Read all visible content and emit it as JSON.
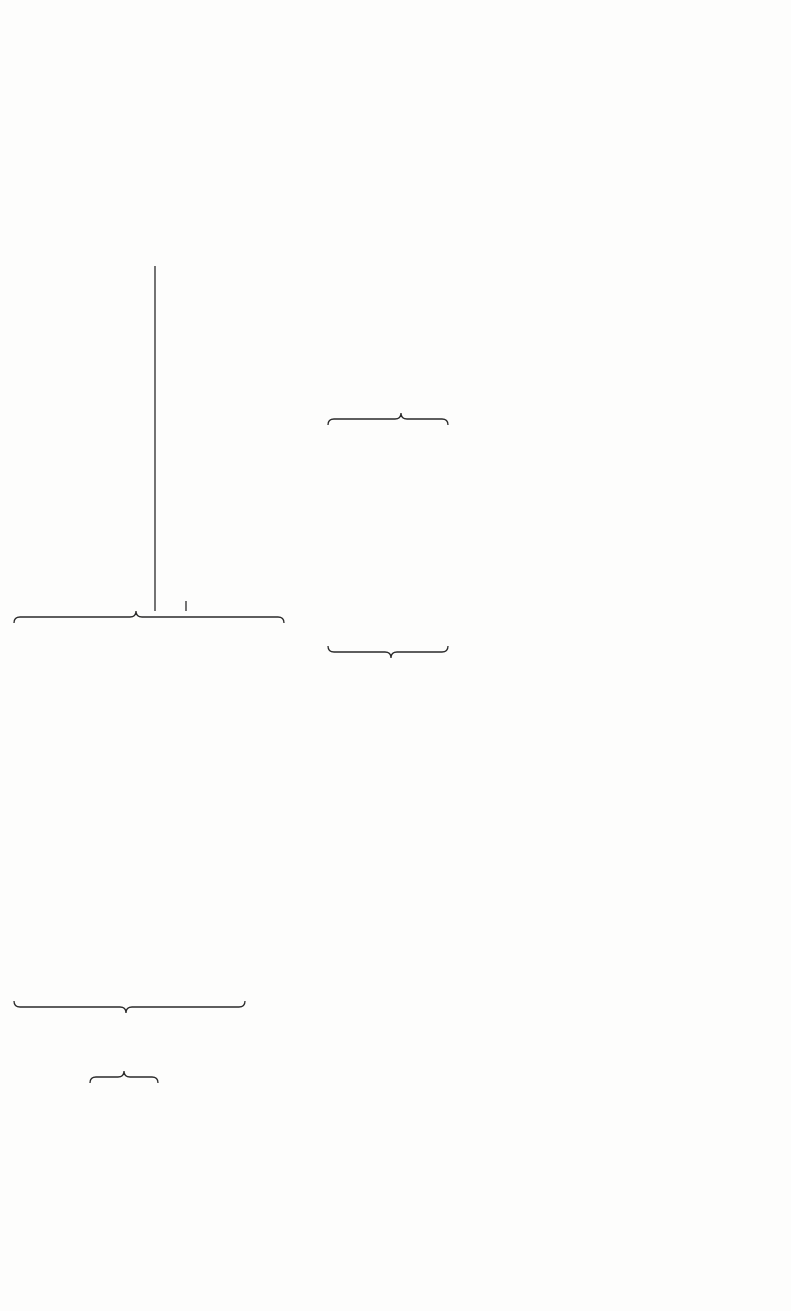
{
  "figure": {
    "orientation": "rotated-90-ccw",
    "revenues": {
      "items": [
        {
          "text": "Cash sales (net of",
          "indent": 0
        },
        {
          "text": "sales taxes)",
          "indent": 3
        },
        {
          "text": "Credit sales (net of",
          "indent": 0
        },
        {
          "text": "sales taxes)",
          "indent": 3
        },
        {
          "text": "Price of home-consumed",
          "indent": 0
        },
        {
          "text": "production",
          "indent": 2
        },
        {
          "text": "Subsidies",
          "indent": 0
        }
      ]
    },
    "operator_minus_1": "−",
    "costs": {
      "items": [
        {
          "text": "Capital equipment",
          "indent": 0
        },
        {
          "text": "and buildings",
          "indent": 2
        },
        {
          "text": "Cash operating expenses",
          "indent": 0
        },
        {
          "text": "for goods sold",
          "indent": 2
        },
        {
          "text": "or consumed",
          "indent": 2
        },
        {
          "text": "Fertilizer",
          "indent": 1
        },
        {
          "text": "Electricity",
          "indent": 1
        },
        {
          "text": "Maintenance supplies",
          "indent": 1
        },
        {
          "text": "Wages",
          "indent": 0
        },
        {
          "text": "Social security",
          "indent": 1
        },
        {
          "text": "Wages in kind",
          "indent": 0
        },
        {
          "text": "Selling, general, and",
          "indent": 0
        },
        {
          "text": "administrative",
          "indent": 2
        },
        {
          "text": "expenses",
          "indent": 3
        },
        {
          "text": "Salaries",
          "indent": 1
        },
        {
          "text": "Bonuses",
          "indent": 1
        },
        {
          "text": "Consulting fees",
          "indent": 1
        },
        {
          "text": "Insurance",
          "indent": 1
        },
        {
          "text": "Change in inventories",
          "indent": 0
        },
        {
          "text": "Raw materials",
          "indent": 1
        },
        {
          "text": "Finished goods",
          "indent": 1
        },
        {
          "text": "Duties and other",
          "indent": 0
        },
        {
          "text": "indirect taxes",
          "indent": 2
        }
      ]
    },
    "operator_plus": "+",
    "financing": {
      "items": [
        {
          "text": "Net financing",
          "indent": 0
        },
        {
          "text": "Loans received (+)",
          "indent": 1
        },
        {
          "text": "Debt service",
          "indent": 1
        },
        {
          "text": "Repayment of",
          "indent": 2
        },
        {
          "text": "principal (−)",
          "indent": 3
        },
        {
          "text": "Interest (−)",
          "indent": 2
        },
        {
          "text": "Accounts receivable (+)",
          "indent": 1
        },
        {
          "text": "Accounts payable (−)",
          "indent": 1
        }
      ]
    },
    "operator_minus_2": "−",
    "income_taxes": {
      "label": "Income taxes"
    },
    "operator_eq_1": "=",
    "operator_eq_2": "=",
    "operator_eq_3": "=",
    "result_before_financing": {
      "items": [
        {
          "text": "Net benefit before",
          "indent": 0
        },
        {
          "text": "financing",
          "indent": 1
        },
        {
          "text": "(remuneration for",
          "indent": 1
        },
        {
          "text": "all resources",
          "indent": 1
        },
        {
          "text": "engaged, including",
          "indent": 1
        },
        {
          "text": "return of capital and",
          "indent": 1
        },
        {
          "text": "return to capital)",
          "indent": 1
        }
      ]
    },
    "result_after_financing": {
      "items": [
        {
          "text": "Net benefit after",
          "indent": 0
        },
        {
          "text": "financing",
          "indent": 1
        },
        {
          "text": "[remuneration for",
          "indent": 1
        },
        {
          "text": "entity's own capital",
          "indent": 1
        },
        {
          "text": "(equity) before income",
          "indent": 1
        },
        {
          "text": "taxes, including",
          "indent": 1
        },
        {
          "text": "return of entity's own",
          "indent": 1
        },
        {
          "text": "capital (equity) and",
          "indent": 1
        },
        {
          "text": "return to entity's own",
          "indent": 1
        },
        {
          "text": "capital (equity)",
          "indent": 1
        },
        {
          "text": "before taxes]",
          "indent": 1
        }
      ]
    },
    "result_after_taxes": {
      "items": [
        {
          "text": "Net benefit after",
          "indent": 0
        },
        {
          "text": "financing and taxes",
          "indent": 1
        },
        {
          "text": "[remuneration for",
          "indent": 1
        },
        {
          "text": "entity's own capital",
          "indent": 1
        },
        {
          "text": "(equity) after financing",
          "indent": 1
        },
        {
          "text": "and taxes, including",
          "indent": 1
        },
        {
          "text": "return of entity's own",
          "indent": 1
        },
        {
          "text": "capital (equity) and",
          "indent": 1
        },
        {
          "text": "return to entity's own",
          "indent": 1
        },
        {
          "text": "capital (equity)",
          "indent": 1
        },
        {
          "text": "after taxes]",
          "indent": 1
        }
      ]
    },
    "ink_color": "#2a2a2a",
    "paper_color": "#fdfdfc"
  }
}
